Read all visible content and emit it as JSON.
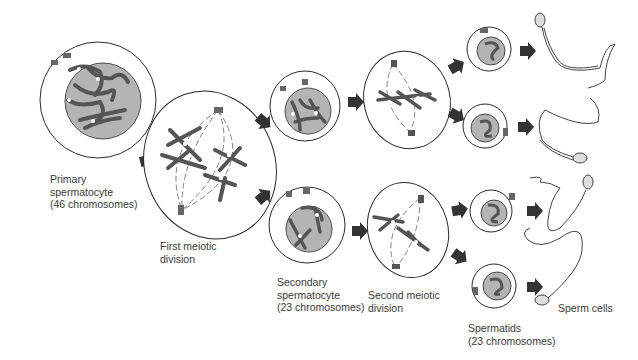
{
  "colors": {
    "outline": "#2a2a2a",
    "nucleus": "#b4b4b4",
    "chromosome": "#555555",
    "arrow": "#333333",
    "background": "#ffffff"
  },
  "labels": {
    "primary": {
      "line1": "Primary",
      "line2": "spermatocyte",
      "line3": "(46 chromosomes)"
    },
    "first_division": {
      "line1": "First meiotic",
      "line2": "division"
    },
    "secondary": {
      "line1": "Secondary",
      "line2": "spermatocyte",
      "line3": "(23 chromosomes)"
    },
    "second_division": {
      "line1": "Second meiotic",
      "line2": "division"
    },
    "spermatids": {
      "line1": "Spermatids",
      "line2": "(23 chromosomes)"
    },
    "sperm": {
      "line1": "Sperm cells"
    }
  },
  "stages": [
    {
      "name": "Primary spermatocyte",
      "count": 1,
      "chromosomes": 46
    },
    {
      "name": "First meiotic division",
      "count": 1
    },
    {
      "name": "Secondary spermatocyte",
      "count": 2,
      "chromosomes": 23
    },
    {
      "name": "Second meiotic division",
      "count": 2
    },
    {
      "name": "Spermatids",
      "count": 4,
      "chromosomes": 23
    },
    {
      "name": "Sperm cells",
      "count": 4
    }
  ]
}
